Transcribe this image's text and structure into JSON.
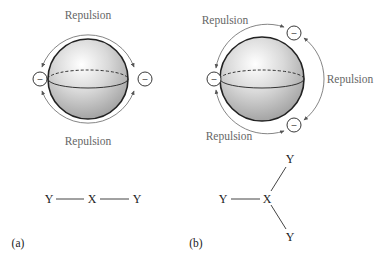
{
  "panels": [
    {
      "id": "a",
      "label": "(a)",
      "repulsion_labels": [
        "Repulsion",
        "Repulsion"
      ],
      "electron_pairs": 2,
      "electron_symbol": "–",
      "molecule": {
        "central": "X",
        "ligands": [
          "Y",
          "Y"
        ],
        "geometry": "linear"
      }
    },
    {
      "id": "b",
      "label": "(b)",
      "repulsion_labels": [
        "Repulsion",
        "Repulsion",
        "Repulsion"
      ],
      "electron_pairs": 3,
      "electron_symbol": "–",
      "molecule": {
        "central": "X",
        "ligands": [
          "Y",
          "Y",
          "Y"
        ],
        "geometry": "trigonal planar"
      }
    }
  ]
}
